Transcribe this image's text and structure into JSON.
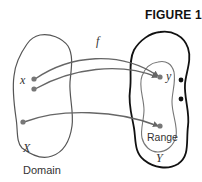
{
  "figure": {
    "title": "FIGURE 1",
    "function_label": "f",
    "domain": {
      "set_label": "X",
      "caption": "Domain",
      "element_label": "x"
    },
    "codomain": {
      "set_label": "Y",
      "range_label": "Range",
      "element_label": "y"
    },
    "colors": {
      "outline_domain": "#555555",
      "outline_codomain": "#111111",
      "outline_range": "#777777",
      "arrow": "#666666",
      "point": "#777777",
      "unmapped_point": "#111111"
    }
  }
}
